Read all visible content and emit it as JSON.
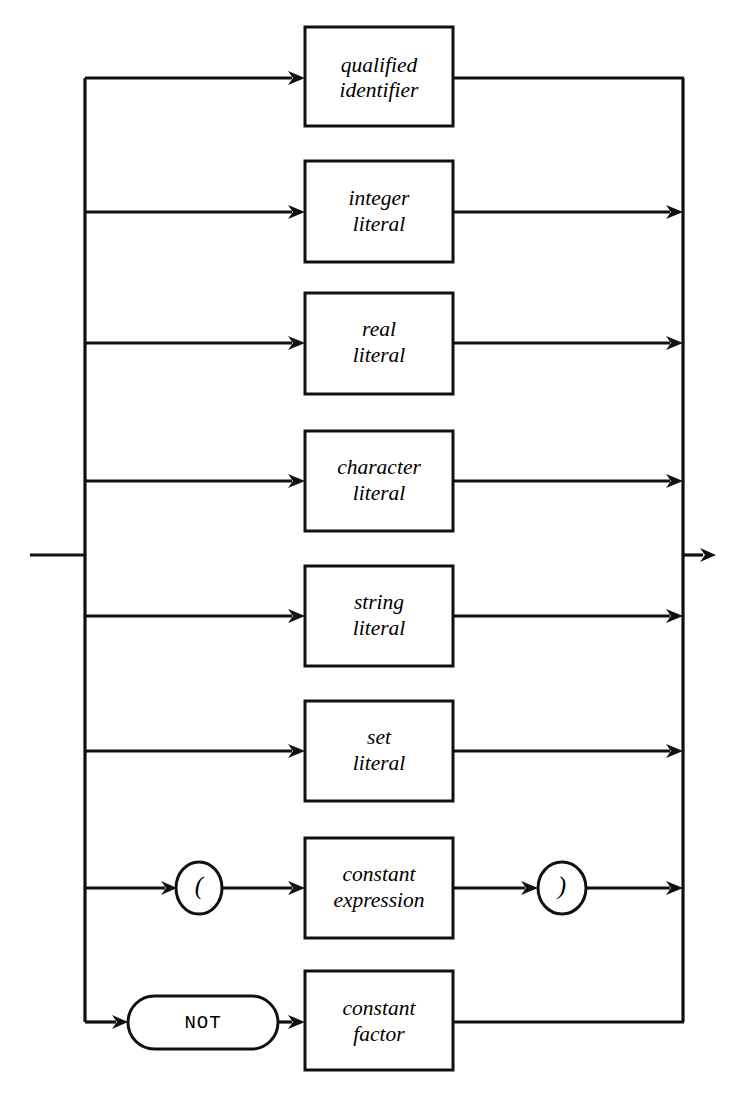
{
  "diagram": {
    "kind": "railroad-syntax-diagram",
    "name": "constant factor",
    "canvas": {
      "width": 753,
      "height": 1096,
      "background": "#ffffff"
    },
    "ink_color": "#101010",
    "entry": {
      "x_start": 30,
      "x_end": 85,
      "y": 555
    },
    "exit": {
      "x_start": 683,
      "x_end": 716,
      "y": 555
    },
    "left_bus": {
      "x": 85,
      "y_top": 78,
      "y_bottom": 1022
    },
    "right_bus": {
      "x": 683,
      "y_top": 78,
      "y_bottom": 1022
    },
    "rows": [
      {
        "id": "qualified-identifier",
        "y": 78,
        "label_line1": "qualified",
        "label_line2": "identifier",
        "box": {
          "x": 305,
          "y": 27,
          "w": 148,
          "h": 99
        },
        "entry_arrow": true,
        "exit_arrow": false
      },
      {
        "id": "integer-literal",
        "y": 212,
        "label_line1": "integer",
        "label_line2": "literal",
        "box": {
          "x": 305,
          "y": 161,
          "w": 148,
          "h": 101
        },
        "entry_arrow": true,
        "exit_arrow": true
      },
      {
        "id": "real-literal",
        "y": 343,
        "label_line1": "real",
        "label_line2": "literal",
        "box": {
          "x": 305,
          "y": 293,
          "w": 148,
          "h": 101
        },
        "entry_arrow": true,
        "exit_arrow": true
      },
      {
        "id": "character-literal",
        "y": 481,
        "label_line1": "character",
        "label_line2": "literal",
        "box": {
          "x": 305,
          "y": 431,
          "w": 148,
          "h": 100
        },
        "entry_arrow": true,
        "exit_arrow": true
      },
      {
        "id": "string-literal",
        "y": 616,
        "label_line1": "string",
        "label_line2": "literal",
        "box": {
          "x": 305,
          "y": 566,
          "w": 148,
          "h": 100
        },
        "entry_arrow": true,
        "exit_arrow": true
      },
      {
        "id": "set-literal",
        "y": 751,
        "label_line1": "set",
        "label_line2": "literal",
        "box": {
          "x": 305,
          "y": 701,
          "w": 148,
          "h": 100
        },
        "entry_arrow": true,
        "exit_arrow": true
      },
      {
        "id": "constant-expression",
        "y": 888,
        "label_line1": "constant",
        "label_line2": "expression",
        "box": {
          "x": 305,
          "y": 838,
          "w": 148,
          "h": 100
        },
        "entry_arrow": true,
        "exit_arrow": true,
        "open_paren": {
          "cx": 199,
          "cy": 888,
          "rx": 23,
          "ry": 26,
          "text": "("
        },
        "close_paren": {
          "cx": 562,
          "cy": 888,
          "rx": 24,
          "ry": 26,
          "text": ")"
        }
      },
      {
        "id": "constant-factor",
        "y": 1022,
        "label_line1": "constant",
        "label_line2": "factor",
        "box": {
          "x": 305,
          "y": 971,
          "w": 148,
          "h": 99
        },
        "entry_arrow": true,
        "exit_arrow": false,
        "keyword": {
          "text": "NOT",
          "x": 128,
          "y": 996,
          "w": 150,
          "h": 53,
          "shape": "stadium"
        }
      }
    ]
  }
}
